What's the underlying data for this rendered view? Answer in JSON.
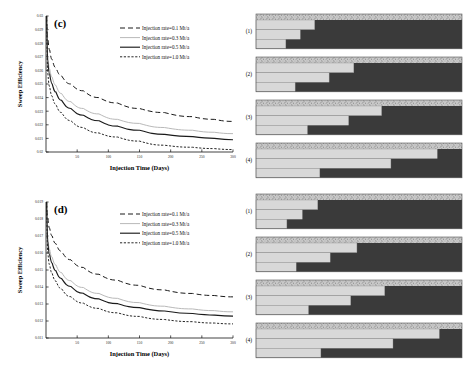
{
  "figure": {
    "background": "#ffffff",
    "axis_color": "#111111"
  },
  "chart_data": [
    {
      "id": "c",
      "type": "line",
      "panel_label": "(c)",
      "title": "",
      "xlabel": "Injection Time  (Days)",
      "ylabel": "Sweep Efficiency",
      "xlim": [
        0,
        300
      ],
      "ylim": [
        0.02,
        0.03
      ],
      "xticks": [
        50,
        100,
        150,
        200,
        250,
        300
      ],
      "xticklabels": [
        "50",
        "100",
        "150",
        "200",
        "250",
        "300"
      ],
      "yticks": [
        0.02,
        0.021,
        0.022,
        0.023,
        0.024,
        0.025,
        0.026,
        0.027,
        0.028,
        0.029,
        0.03
      ],
      "yticklabels": [
        "0.02",
        "0.021",
        "0.022",
        "0.023",
        "0.024",
        "0.025",
        "0.026",
        "0.027",
        "0.028",
        "0.029",
        "0.03"
      ],
      "grid": false,
      "legend_position": "upper right",
      "series": [
        {
          "name": "Injection rate=0.1 Mt/a",
          "style": "dashed",
          "color": "#1a1a1a",
          "dash": "5,3",
          "width": 1.0,
          "x": [
            1,
            3,
            6,
            10,
            16,
            25,
            40,
            60,
            85,
            115,
            150,
            190,
            235,
            270,
            300
          ],
          "y": [
            0.03,
            0.0284,
            0.0275,
            0.0268,
            0.0262,
            0.0256,
            0.025,
            0.0245,
            0.024,
            0.0236,
            0.0232,
            0.0229,
            0.0226,
            0.0224,
            0.02225
          ]
        },
        {
          "name": "Injection rate=0.3 Mt/a",
          "style": "solid-light",
          "color": "#b9b9b9",
          "dash": "none",
          "width": 1.0,
          "x": [
            1,
            3,
            6,
            10,
            16,
            25,
            40,
            60,
            85,
            115,
            150,
            190,
            235,
            270,
            300
          ],
          "y": [
            0.03,
            0.027,
            0.0261,
            0.0255,
            0.0249,
            0.0243,
            0.0237,
            0.0232,
            0.0228,
            0.0224,
            0.0221,
            0.0218,
            0.0216,
            0.02145,
            0.02135
          ]
        },
        {
          "name": "Injection rate=0.5 Mt/a",
          "style": "solid",
          "color": "#1a1a1a",
          "dash": "none",
          "width": 1.15,
          "x": [
            1,
            3,
            6,
            10,
            16,
            25,
            40,
            60,
            85,
            115,
            150,
            190,
            235,
            270,
            300
          ],
          "y": [
            0.03,
            0.0266,
            0.0257,
            0.025,
            0.0244,
            0.0238,
            0.0232,
            0.0227,
            0.0223,
            0.0219,
            0.0216,
            0.0213,
            0.02113,
            0.021,
            0.0209
          ]
        },
        {
          "name": "Injection rate=1.0 Mt/a",
          "style": "dotted",
          "color": "#1a1a1a",
          "dash": "2.2,1.6",
          "width": 0.95,
          "x": [
            1,
            3,
            6,
            10,
            16,
            25,
            40,
            60,
            85,
            115,
            150,
            190,
            235,
            270,
            300
          ],
          "y": [
            0.03,
            0.0258,
            0.0248,
            0.0241,
            0.0235,
            0.0229,
            0.0223,
            0.0218,
            0.0214,
            0.0211,
            0.0208,
            0.0205,
            0.02035,
            0.02025,
            0.02018
          ]
        }
      ]
    },
    {
      "id": "d",
      "type": "line",
      "panel_label": "(d)",
      "title": "",
      "xlabel": "Injection Time  (Days)",
      "ylabel": "Sweep Efficiency",
      "xlim": [
        0,
        300
      ],
      "ylim": [
        0.011,
        0.019
      ],
      "xticks": [
        50,
        100,
        150,
        200,
        250,
        300
      ],
      "xticklabels": [
        "50",
        "100",
        "150",
        "200",
        "250",
        "300"
      ],
      "yticks": [
        0.011,
        0.012,
        0.013,
        0.014,
        0.015,
        0.016,
        0.017,
        0.018,
        0.019
      ],
      "yticklabels": [
        "0.011",
        "0.012",
        "0.013",
        "0.014",
        "0.015",
        "0.016",
        "0.017",
        "0.018",
        "0.019"
      ],
      "grid": false,
      "legend_position": "upper right",
      "series": [
        {
          "name": "Injection rate=0.1 Mt/a",
          "style": "dashed",
          "color": "#1a1a1a",
          "dash": "5,3",
          "width": 1.0,
          "x": [
            1,
            3,
            6,
            10,
            16,
            25,
            40,
            60,
            85,
            115,
            150,
            190,
            235,
            270,
            300
          ],
          "y": [
            0.019,
            0.01805,
            0.01745,
            0.017,
            0.01655,
            0.0161,
            0.0156,
            0.01515,
            0.01475,
            0.0144,
            0.0141,
            0.01383,
            0.01362,
            0.0135,
            0.01342
          ]
        },
        {
          "name": "Injection rate=0.3 Mt/a",
          "style": "solid-light",
          "color": "#b9b9b9",
          "dash": "none",
          "width": 1.0,
          "x": [
            1,
            3,
            6,
            10,
            16,
            25,
            40,
            60,
            85,
            115,
            150,
            190,
            235,
            270,
            300
          ],
          "y": [
            0.019,
            0.0169,
            0.0162,
            0.01575,
            0.0153,
            0.01485,
            0.01437,
            0.01397,
            0.01362,
            0.01333,
            0.01308,
            0.01287,
            0.01271,
            0.01261,
            0.01254
          ]
        },
        {
          "name": "Injection rate=0.5 Mt/a",
          "style": "solid",
          "color": "#1a1a1a",
          "dash": "none",
          "width": 1.15,
          "x": [
            1,
            3,
            6,
            10,
            16,
            25,
            40,
            60,
            85,
            115,
            150,
            190,
            235,
            270,
            300
          ],
          "y": [
            0.019,
            0.0166,
            0.01588,
            0.0154,
            0.01495,
            0.0145,
            0.01403,
            0.01363,
            0.0133,
            0.01302,
            0.01279,
            0.01259,
            0.01244,
            0.01235,
            0.01229
          ]
        },
        {
          "name": "Injection rate=1.0 Mt/a",
          "style": "dotted",
          "color": "#1a1a1a",
          "dash": "2.2,1.6",
          "width": 0.95,
          "x": [
            1,
            3,
            6,
            10,
            16,
            25,
            40,
            60,
            85,
            115,
            150,
            190,
            235,
            270,
            300
          ],
          "y": [
            0.019,
            0.01605,
            0.0153,
            0.0148,
            0.01435,
            0.0139,
            0.01343,
            0.01305,
            0.01274,
            0.01248,
            0.01227,
            0.01209,
            0.01196,
            0.01188,
            0.01183
          ]
        }
      ]
    }
  ],
  "panel_groups": [
    {
      "id": "c-sections",
      "panels": [
        {
          "label": "(1)",
          "caprock_fraction": 1.0,
          "layers": [
            0.285,
            0.215,
            0.145
          ]
        },
        {
          "label": "(2)",
          "caprock_fraction": 1.0,
          "layers": [
            0.475,
            0.355,
            0.19
          ]
        },
        {
          "label": "(3)",
          "caprock_fraction": 1.0,
          "layers": [
            0.61,
            0.45,
            0.25
          ]
        },
        {
          "label": "(4)",
          "caprock_fraction": 1.0,
          "layers": [
            0.88,
            0.655,
            0.31
          ]
        }
      ]
    },
    {
      "id": "d-sections",
      "panels": [
        {
          "label": "(1)",
          "caprock_fraction": 1.0,
          "layers": [
            0.3,
            0.225,
            0.15
          ]
        },
        {
          "label": "(2)",
          "caprock_fraction": 1.0,
          "layers": [
            0.49,
            0.36,
            0.195
          ]
        },
        {
          "label": "(3)",
          "caprock_fraction": 1.0,
          "layers": [
            0.625,
            0.46,
            0.255
          ]
        },
        {
          "label": "(4)",
          "caprock_fraction": 1.0,
          "layers": [
            0.89,
            0.665,
            0.315
          ]
        }
      ]
    }
  ],
  "colors": {
    "reservoir_dark": "#3a3a3a",
    "swept_light": "#d8d8d8",
    "caprock": "#c4c4c4",
    "panel_border": "#555555",
    "curve_dark": "#1a1a1a",
    "curve_light": "#b9b9b9"
  }
}
